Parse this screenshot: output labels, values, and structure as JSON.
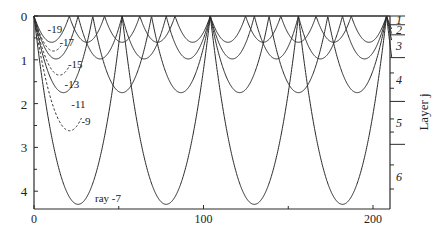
{
  "chart_data": {
    "type": "line",
    "title": "",
    "xlabel": "",
    "ylabel": "",
    "right_axis_label": "Layer j",
    "xlim": [
      0,
      211
    ],
    "ylim": [
      0,
      4.4
    ],
    "y_inverted": true,
    "x_ticks": [
      0,
      100,
      200
    ],
    "x_minor_ticks": [
      50,
      150
    ],
    "y_ticks": [
      0,
      1,
      2,
      3,
      4
    ],
    "y_minor_ticks": [
      0.5,
      1.5,
      2.5,
      3.5
    ],
    "grid": false,
    "layers": {
      "boundaries_depth": [
        0,
        0.2,
        0.43,
        0.95,
        1.95,
        2.93,
        4.4
      ],
      "labels": [
        "1",
        "2",
        "3",
        "4",
        "5",
        "6"
      ]
    },
    "convergence_x": [
      0,
      104,
      208
    ],
    "series": [
      {
        "name": "ray -19",
        "label": "-19",
        "style": "solid",
        "max_depth": 0.6,
        "half_period": 20.8,
        "x_end": 211
      },
      {
        "name": "ray -17",
        "label": "-17",
        "style": "dashed",
        "max_depth": 0.8,
        "half_period": 23,
        "x_end": 16
      },
      {
        "name": "ray -15",
        "label": "-15",
        "style": "solid",
        "max_depth": 0.98,
        "half_period": 26,
        "x_end": 211
      },
      {
        "name": "ray -13",
        "label": "-13",
        "style": "dashed",
        "max_depth": 1.35,
        "half_period": 30,
        "x_end": 21
      },
      {
        "name": "ray -11",
        "label": "-11",
        "style": "solid",
        "max_depth": 1.75,
        "half_period": 34.67,
        "x_end": 211
      },
      {
        "name": "ray -9",
        "label": "-9",
        "style": "dashed",
        "max_depth": 2.62,
        "half_period": 42,
        "x_end": 28
      },
      {
        "name": "ray -7",
        "label": "ray -7",
        "style": "solid",
        "max_depth": 4.3,
        "half_period": 52,
        "x_end": 211
      }
    ],
    "annotations": [
      {
        "text": "-19",
        "x": 8,
        "depth": 0.3
      },
      {
        "text": "-17",
        "x": 15,
        "depth": 0.6
      },
      {
        "text": "-15",
        "x": 20,
        "depth": 1.1
      },
      {
        "text": "-13",
        "x": 18,
        "depth": 1.55
      },
      {
        "text": "-11",
        "x": 22,
        "depth": 2.0
      },
      {
        "text": "-9",
        "x": 28,
        "depth": 2.4
      },
      {
        "text": "ray -7",
        "x": 36,
        "depth": 4.15
      }
    ]
  },
  "colors": {
    "line": "#2a2a2a",
    "background": "#ffffff",
    "text": "#222222"
  }
}
